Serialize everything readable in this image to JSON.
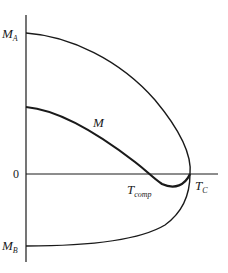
{
  "diagram": {
    "axis": {
      "zero_label": "0"
    },
    "labels": {
      "ma": {
        "main": "M",
        "sub": "A"
      },
      "mb": {
        "main": "M",
        "sub": "B"
      },
      "m": {
        "main": "M"
      },
      "tcomp": {
        "main": "T",
        "sub": "comp"
      },
      "tc": {
        "main": "T",
        "sub": "C"
      }
    },
    "curves": [
      {
        "name": "M_A",
        "description": "sublattice A magnetization, positive, falls to zero at T_C"
      },
      {
        "name": "M_B",
        "description": "sublattice B magnetization, negative, rises to zero at T_C"
      },
      {
        "name": "M",
        "description": "net magnetization, crosses zero at T_comp, vanishes at T_C"
      }
    ],
    "colors": {
      "ink": "#1a1a1a",
      "background": "#ffffff"
    }
  }
}
